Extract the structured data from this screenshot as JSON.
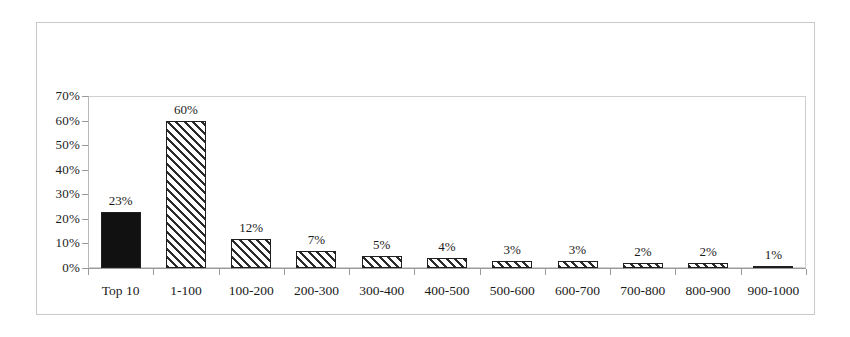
{
  "chart_data": {
    "type": "bar",
    "title": "",
    "subtitle": "",
    "xlabel": "",
    "ylabel": "",
    "ylim": [
      0,
      70
    ],
    "ytick_values": [
      0,
      10,
      20,
      30,
      40,
      50,
      60,
      70
    ],
    "ytick_labels": [
      "0%",
      "10%",
      "20%",
      "30%",
      "40%",
      "50%",
      "60%",
      "70%"
    ],
    "grid": false,
    "legend": null,
    "categories": [
      "Top 10",
      "1-100",
      "100-200",
      "200-300",
      "300-400",
      "400-500",
      "500-600",
      "600-700",
      "700-800",
      "800-900",
      "900-1000"
    ],
    "values": [
      23,
      60,
      12,
      7,
      5,
      4,
      3,
      3,
      2,
      2,
      1
    ],
    "data_labels": [
      "23%",
      "60%",
      "12%",
      "7%",
      "5%",
      "4%",
      "3%",
      "3%",
      "2%",
      "2%",
      "1%"
    ],
    "bar_styles": [
      "solid-black",
      "diagonal-hatch",
      "diagonal-hatch",
      "diagonal-hatch",
      "diagonal-hatch",
      "diagonal-hatch",
      "diagonal-hatch",
      "diagonal-hatch",
      "diagonal-hatch",
      "diagonal-hatch",
      "diagonal-hatch"
    ],
    "colors": {
      "bar_solid": "#111111",
      "bar_hatch_line": "#2b2b2b",
      "bar_hatch_background": "#ffffff",
      "bar_border": "#1f1f1f",
      "axis_line": "#9a9a9a",
      "plot_frame": "#cfcfcf",
      "outer_frame": "#c9c9c9",
      "text": "#1a1a1a",
      "background": "#ffffff"
    }
  }
}
